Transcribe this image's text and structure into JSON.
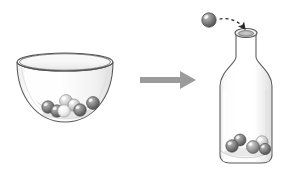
{
  "illustration": {
    "title": "Marbles transferred from a bowl into a bottle",
    "caption": "",
    "background_color": "#ffffff",
    "width": 288,
    "height": 174
  },
  "palette": {
    "outline": "#4d4d4d",
    "glass_fill": "#ffffff",
    "glass_shade": "#e9e9e9",
    "glass_shade_light": "#f4f4f4",
    "marble_dark": "#6e6e6e",
    "marble_dark_edge": "#4f4f4f",
    "marble_mid": "#9a9a9a",
    "marble_light": "#d8d8d8",
    "marble_white": "#f2f2f2",
    "marble_highlight": "#ffffff",
    "arrow_gray": "#9b9b9b",
    "dashed_arrow": "#2b2b2b"
  },
  "bowl": {
    "label": "bowl",
    "rim_center_x": 65,
    "rim_center_y": 62,
    "rim_rx": 48,
    "rim_ry": 9,
    "depth_y": 122,
    "marble_count": 7,
    "marbles": [
      {
        "name": "bowl-marble-1",
        "cx": 48,
        "cy": 107,
        "r": 6.2,
        "tone": "dark"
      },
      {
        "name": "bowl-marble-2",
        "cx": 57,
        "cy": 111,
        "r": 6.2,
        "tone": "dark"
      },
      {
        "name": "bowl-marble-3",
        "cx": 66,
        "cy": 101,
        "r": 6.4,
        "tone": "light"
      },
      {
        "name": "bowl-marble-4",
        "cx": 64,
        "cy": 111,
        "r": 6.2,
        "tone": "white"
      },
      {
        "name": "bowl-marble-5",
        "cx": 74,
        "cy": 105,
        "r": 6.0,
        "tone": "light"
      },
      {
        "name": "bowl-marble-6",
        "cx": 80,
        "cy": 110,
        "r": 6.2,
        "tone": "dark"
      },
      {
        "name": "bowl-marble-7",
        "cx": 93,
        "cy": 103,
        "r": 6.4,
        "tone": "dark"
      }
    ]
  },
  "transfer_arrow": {
    "label": "transfer arrow",
    "direction": "right",
    "x_start": 140,
    "x_end": 196,
    "y": 80,
    "shaft_thickness": 6,
    "head_width": 16,
    "head_height": 18,
    "color": "#9b9b9b"
  },
  "bottle": {
    "label": "bottle",
    "body_left": 220,
    "body_right": 272,
    "bottom_y": 163,
    "shoulder_y": 60,
    "neck_left": 236,
    "neck_right": 256,
    "mouth_center_x": 246,
    "mouth_center_y": 33,
    "mouth_rx": 11,
    "mouth_ry": 4.5,
    "marble_count": 5,
    "marbles": [
      {
        "name": "bottle-marble-1",
        "cx": 232,
        "cy": 146,
        "r": 6.2,
        "tone": "dark"
      },
      {
        "name": "bottle-marble-2",
        "cx": 240,
        "cy": 140,
        "r": 6.0,
        "tone": "dark"
      },
      {
        "name": "bottle-marble-3",
        "cx": 253,
        "cy": 147,
        "r": 6.4,
        "tone": "mid"
      },
      {
        "name": "bottle-marble-4",
        "cx": 262,
        "cy": 142,
        "r": 6.2,
        "tone": "light"
      },
      {
        "name": "bottle-marble-5",
        "cx": 265,
        "cy": 149,
        "r": 5.6,
        "tone": "dark"
      }
    ]
  },
  "falling_marble": {
    "name": "falling-marble",
    "cx": 209,
    "cy": 20,
    "r": 7.2,
    "tone": "dark"
  },
  "dashed_path": {
    "label": "dashed motion path",
    "start_x": 219,
    "start_y": 19,
    "end_x": 246,
    "end_y": 31,
    "dash": "3 3",
    "arrowhead": "filled-triangle"
  }
}
